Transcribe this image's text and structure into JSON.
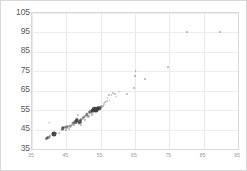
{
  "chart_data": {
    "type": "scatter",
    "title": "",
    "xlabel": "",
    "ylabel": "",
    "xlim": [
      35,
      95
    ],
    "ylim": [
      35,
      105
    ],
    "xticks": [
      35,
      45,
      55,
      65,
      75,
      85,
      95
    ],
    "yticks": [
      35,
      45,
      55,
      65,
      75,
      85,
      95,
      105
    ],
    "grid": true,
    "legend": "none",
    "marker_color": "#3f3f3f",
    "series": [
      {
        "name": "observations",
        "points": [
          {
            "x": 39.0,
            "y": 40.2,
            "size": 2.0,
            "opacity": 0.55
          },
          {
            "x": 39.4,
            "y": 40.8,
            "size": 3.0,
            "opacity": 0.75
          },
          {
            "x": 39.8,
            "y": 41.0,
            "size": 2.2,
            "opacity": 0.5
          },
          {
            "x": 40.2,
            "y": 41.6,
            "size": 2.4,
            "opacity": 0.45
          },
          {
            "x": 40.0,
            "y": 48.5,
            "size": 1.6,
            "opacity": 0.4
          },
          {
            "x": 41.3,
            "y": 42.6,
            "size": 5.2,
            "opacity": 0.95
          },
          {
            "x": 42.0,
            "y": 43.2,
            "size": 2.0,
            "opacity": 0.4
          },
          {
            "x": 43.0,
            "y": 43.0,
            "size": 1.6,
            "opacity": 0.35
          },
          {
            "x": 43.6,
            "y": 44.6,
            "size": 2.0,
            "opacity": 0.4
          },
          {
            "x": 44.0,
            "y": 45.6,
            "size": 3.6,
            "opacity": 0.8
          },
          {
            "x": 44.4,
            "y": 46.0,
            "size": 2.8,
            "opacity": 0.55
          },
          {
            "x": 44.8,
            "y": 45.0,
            "size": 2.2,
            "opacity": 0.45
          },
          {
            "x": 45.0,
            "y": 46.4,
            "size": 3.2,
            "opacity": 0.6
          },
          {
            "x": 45.4,
            "y": 47.0,
            "size": 2.0,
            "opacity": 0.4
          },
          {
            "x": 45.8,
            "y": 45.4,
            "size": 1.8,
            "opacity": 0.35
          },
          {
            "x": 46.2,
            "y": 46.8,
            "size": 2.6,
            "opacity": 0.5
          },
          {
            "x": 46.6,
            "y": 47.6,
            "size": 2.2,
            "opacity": 0.45
          },
          {
            "x": 46.8,
            "y": 48.4,
            "size": 3.0,
            "opacity": 0.6
          },
          {
            "x": 47.2,
            "y": 47.2,
            "size": 2.0,
            "opacity": 0.4
          },
          {
            "x": 47.6,
            "y": 48.8,
            "size": 3.4,
            "opacity": 0.7
          },
          {
            "x": 48.0,
            "y": 49.6,
            "size": 4.6,
            "opacity": 0.9
          },
          {
            "x": 48.2,
            "y": 50.4,
            "size": 3.0,
            "opacity": 0.55
          },
          {
            "x": 48.4,
            "y": 52.4,
            "size": 2.0,
            "opacity": 0.4
          },
          {
            "x": 48.6,
            "y": 48.2,
            "size": 2.4,
            "opacity": 0.45
          },
          {
            "x": 49.0,
            "y": 49.0,
            "size": 4.2,
            "opacity": 0.85
          },
          {
            "x": 49.2,
            "y": 50.0,
            "size": 3.6,
            "opacity": 0.7
          },
          {
            "x": 49.4,
            "y": 47.6,
            "size": 2.0,
            "opacity": 0.4
          },
          {
            "x": 49.8,
            "y": 50.8,
            "size": 2.6,
            "opacity": 0.5
          },
          {
            "x": 50.0,
            "y": 51.4,
            "size": 3.0,
            "opacity": 0.55
          },
          {
            "x": 50.4,
            "y": 49.8,
            "size": 2.2,
            "opacity": 0.4
          },
          {
            "x": 50.8,
            "y": 52.2,
            "size": 2.8,
            "opacity": 0.5
          },
          {
            "x": 51.0,
            "y": 53.0,
            "size": 3.2,
            "opacity": 0.6
          },
          {
            "x": 51.4,
            "y": 51.8,
            "size": 2.4,
            "opacity": 0.45
          },
          {
            "x": 51.8,
            "y": 53.6,
            "size": 2.6,
            "opacity": 0.5
          },
          {
            "x": 52.0,
            "y": 54.2,
            "size": 3.6,
            "opacity": 0.7
          },
          {
            "x": 52.4,
            "y": 52.8,
            "size": 2.2,
            "opacity": 0.4
          },
          {
            "x": 52.8,
            "y": 54.8,
            "size": 4.8,
            "opacity": 0.92
          },
          {
            "x": 53.2,
            "y": 55.4,
            "size": 4.4,
            "opacity": 0.88
          },
          {
            "x": 53.6,
            "y": 55.0,
            "size": 5.0,
            "opacity": 0.95
          },
          {
            "x": 54.0,
            "y": 55.8,
            "size": 4.6,
            "opacity": 0.9
          },
          {
            "x": 54.4,
            "y": 56.0,
            "size": 4.0,
            "opacity": 0.8
          },
          {
            "x": 54.8,
            "y": 55.6,
            "size": 3.4,
            "opacity": 0.65
          },
          {
            "x": 55.2,
            "y": 56.4,
            "size": 2.8,
            "opacity": 0.5
          },
          {
            "x": 55.6,
            "y": 57.0,
            "size": 2.2,
            "opacity": 0.42
          },
          {
            "x": 56.0,
            "y": 58.4,
            "size": 2.0,
            "opacity": 0.4
          },
          {
            "x": 56.4,
            "y": 59.0,
            "size": 1.8,
            "opacity": 0.35
          },
          {
            "x": 56.8,
            "y": 59.8,
            "size": 2.0,
            "opacity": 0.38
          },
          {
            "x": 57.0,
            "y": 61.4,
            "size": 1.8,
            "opacity": 0.35
          },
          {
            "x": 57.4,
            "y": 62.6,
            "size": 2.0,
            "opacity": 0.4
          },
          {
            "x": 57.6,
            "y": 60.2,
            "size": 1.6,
            "opacity": 0.32
          },
          {
            "x": 58.2,
            "y": 62.8,
            "size": 1.8,
            "opacity": 0.35
          },
          {
            "x": 58.6,
            "y": 64.0,
            "size": 2.0,
            "opacity": 0.38
          },
          {
            "x": 58.8,
            "y": 58.8,
            "size": 1.6,
            "opacity": 0.3
          },
          {
            "x": 59.2,
            "y": 63.4,
            "size": 1.8,
            "opacity": 0.35
          },
          {
            "x": 59.6,
            "y": 62.0,
            "size": 1.6,
            "opacity": 0.3
          },
          {
            "x": 60.4,
            "y": 64.4,
            "size": 1.6,
            "opacity": 0.3
          },
          {
            "x": 62.6,
            "y": 63.2,
            "size": 1.8,
            "opacity": 0.35
          },
          {
            "x": 64.8,
            "y": 66.6,
            "size": 2.0,
            "opacity": 0.42
          },
          {
            "x": 65.0,
            "y": 72.8,
            "size": 2.0,
            "opacity": 0.42
          },
          {
            "x": 65.2,
            "y": 75.0,
            "size": 1.8,
            "opacity": 0.4
          },
          {
            "x": 67.8,
            "y": 70.8,
            "size": 2.0,
            "opacity": 0.42
          },
          {
            "x": 74.6,
            "y": 77.4,
            "size": 2.0,
            "opacity": 0.42
          },
          {
            "x": 80.0,
            "y": 95.0,
            "size": 2.0,
            "opacity": 0.4
          },
          {
            "x": 89.8,
            "y": 95.0,
            "size": 2.0,
            "opacity": 0.4
          }
        ]
      }
    ]
  }
}
